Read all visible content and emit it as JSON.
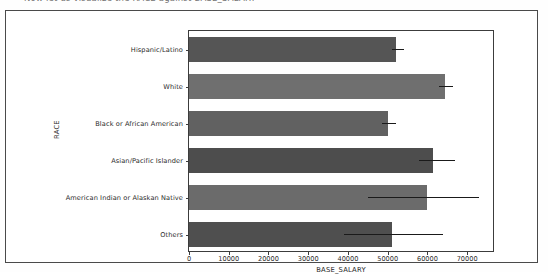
{
  "document": {
    "clipped_heading_text": "Now let us visualize the RACE against BASE_SALARY"
  },
  "chart_data": {
    "type": "bar",
    "orientation": "horizontal",
    "title": "",
    "xlabel": "BASE_SALARY",
    "ylabel": "RACE",
    "categories": [
      "Hispanic/Latino",
      "White",
      "Black or African American",
      "Asian/Pacific Islander",
      "American Indian or Alaskan Native",
      "Others"
    ],
    "values": [
      52000,
      64500,
      50000,
      61500,
      60000,
      51000
    ],
    "error_low": [
      51000,
      63000,
      48500,
      58000,
      45000,
      39000
    ],
    "error_high": [
      54000,
      66500,
      52000,
      67000,
      73000,
      64000
    ],
    "bar_colors": [
      "#555555",
      "#6f6f6f",
      "#616161",
      "#4d4d4d",
      "#6b6b6b",
      "#4f4f4f"
    ],
    "xlim": [
      0,
      77000
    ],
    "ylim_count": 6,
    "xticks": [
      0,
      10000,
      20000,
      30000,
      40000,
      50000,
      60000,
      70000
    ],
    "xtick_labels": [
      "0",
      "10000",
      "20000",
      "30000",
      "40000",
      "50000",
      "60000",
      "70000"
    ],
    "grid": false,
    "legend": null,
    "errorbar_color": "#1a1a1a"
  }
}
